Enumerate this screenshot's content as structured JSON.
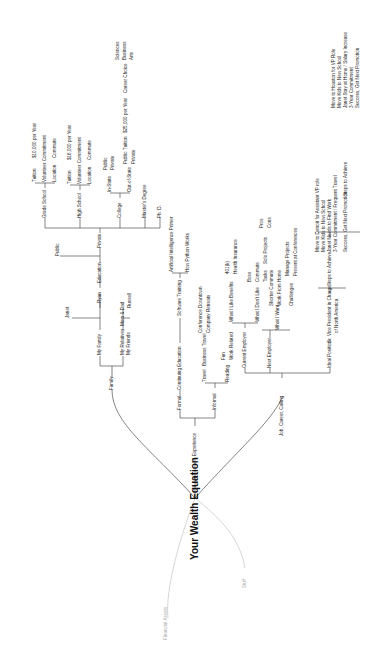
{
  "root": {
    "title": "Your Wealth Equation"
  },
  "faded_branches": {
    "financial_assets": "Financial Assets",
    "stuff": "Stuff"
  },
  "family": {
    "label": "Family",
    "my_family": "My Family",
    "janet": "Janet",
    "ryan": "Ryan",
    "russell": "Russell",
    "my_relatives": "My Relatives",
    "mom_dad": "Mom & Dad",
    "my_friends": "My Friends",
    "education": {
      "label": "Education",
      "public": "Public",
      "private": "Private",
      "grade_school": {
        "label": "Grade School",
        "tuition": "Tuition",
        "tuition_value": "$10,000 per Year",
        "volunteer": "Volunteer Commitment",
        "location": "Location",
        "commute": "Commute"
      },
      "high_school": {
        "label": "High School",
        "tuition": "Tuition",
        "tuition_value": "$16,000 per Year",
        "volunteer": "Volunteer Commitment",
        "location": "Location",
        "commute": "Commute"
      },
      "college": {
        "label": "College",
        "in_state": "In-State",
        "in_public": "Public",
        "in_private": "Private",
        "out_of_state": "Out-of-State",
        "out_public": "Public",
        "tuition": "Tuition",
        "tuition_value": "$25,000 per Year",
        "career_choice": "Career Choice",
        "sciences": "Sciences",
        "business": "Business",
        "arts": "Arts",
        "out_private": "Private"
      },
      "masters": "Master's Degree",
      "phd": "Ph. D."
    }
  },
  "experience": {
    "label": "Experience",
    "formal": "Formal",
    "continuing": "Continuing Education",
    "software": "Software Training",
    "ai": "Artificial Intelligence Primer",
    "python": "How Python Works",
    "informal": "Informal",
    "travel": "Travel",
    "business_travel": "Business Travel",
    "conference": "Conference Downtown",
    "retreats": "Company Retreats",
    "reading": "Reading",
    "fun": "Fun",
    "work_related": "Work Related"
  },
  "job": {
    "label": "Job, Career, Calling",
    "current": {
      "label": "Current Employer",
      "like": "What I Like",
      "benefits": "Benefits",
      "k401": "401(k)",
      "health": "Health Insurance",
      "dislike": "What I Don't Like",
      "boss": "Boss",
      "commute": "Commute",
      "tasks": "Tasks",
      "solo": "Solo Projects",
      "pros": "Pros",
      "cons": "Cons"
    },
    "next": {
      "label": "Next Employer",
      "want": "What I Want",
      "shorter": "Shorter Commute",
      "wfh": "Work From Home",
      "challenges": "Challenges",
      "manage": "Manage Projects",
      "present": "Present at Conferences"
    },
    "ideal": {
      "label": "Ideal Position",
      "vp": "Sr. Vice President in Charge",
      "vp2": "of North America",
      "steps": "Steps to Achieve",
      "s1": "Move to Detroit for Assistant VP role",
      "s2": "Move Kids to New School",
      "s3": "Janet Needs to Find Work",
      "s4": "3-Year Commitment / Frequent Travel",
      "success": "Success, Get Next Promotion",
      "steps2": "Steps to Achieve",
      "t1": "Move to Houston for VP Role",
      "t2": "Move Kids to New School",
      "t3": "Janet Stay at Home / Salary Increase",
      "t4": "3-Year Commitment",
      "t5": "Success, Get Next Promotion"
    }
  }
}
